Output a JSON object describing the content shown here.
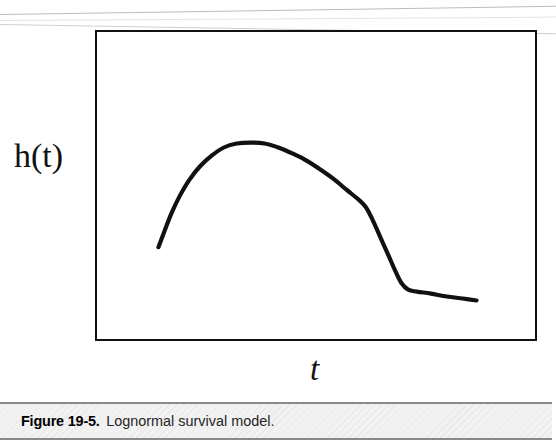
{
  "figure": {
    "caption_number": "Figure 19-5.",
    "caption_title": "Lognormal survival model.",
    "y_axis_label": "h(t)",
    "x_axis_label": "t",
    "frame_color": "#111111",
    "curve_color": "#111111",
    "background_color": "#ffffff",
    "caption_bar_color": "#f2f2f2"
  },
  "chart_data": {
    "type": "line",
    "title": "Lognormal survival model",
    "xlabel": "t",
    "ylabel": "h(t)",
    "legend": [],
    "grid": false,
    "axis_ticks": [],
    "xlim": [
      0,
      1
    ],
    "ylim": [
      0,
      1
    ],
    "annotation": "Hazard function of the lognormal distribution: rises from zero to a single interior maximum, then decays toward zero as t increases.",
    "series": [
      {
        "name": "hazard h(t)",
        "description": "unimodal hazard curve: rapid rise, rounded peak, gradual then steep decline, long flat tail",
        "points_px": [
          [
            157,
            248
          ],
          [
            163,
            232
          ],
          [
            170,
            214
          ],
          [
            178,
            197
          ],
          [
            188,
            180
          ],
          [
            199,
            166
          ],
          [
            211,
            155
          ],
          [
            223,
            147
          ],
          [
            236,
            143
          ],
          [
            250,
            142
          ],
          [
            264,
            143
          ],
          [
            278,
            147
          ],
          [
            292,
            153
          ],
          [
            306,
            160
          ],
          [
            320,
            169
          ],
          [
            334,
            179
          ],
          [
            347,
            190
          ],
          [
            358,
            199
          ],
          [
            366,
            207
          ],
          [
            373,
            220
          ],
          [
            381,
            238
          ],
          [
            389,
            256
          ],
          [
            396,
            272
          ],
          [
            402,
            284
          ],
          [
            409,
            291
          ],
          [
            418,
            293
          ],
          [
            432,
            295
          ],
          [
            448,
            298
          ],
          [
            464,
            300
          ],
          [
            478,
            302
          ]
        ],
        "normalized": [
          [
            0.14,
            0.337
          ],
          [
            0.154,
            0.38
          ],
          [
            0.17,
            0.428
          ],
          [
            0.188,
            0.473
          ],
          [
            0.21,
            0.519
          ],
          [
            0.235,
            0.556
          ],
          [
            0.262,
            0.585
          ],
          [
            0.29,
            0.607
          ],
          [
            0.319,
            0.618
          ],
          [
            0.351,
            0.621
          ],
          [
            0.382,
            0.618
          ],
          [
            0.414,
            0.607
          ],
          [
            0.446,
            0.591
          ],
          [
            0.477,
            0.572
          ],
          [
            0.509,
            0.548
          ],
          [
            0.541,
            0.521
          ],
          [
            0.57,
            0.492
          ],
          [
            0.595,
            0.468
          ],
          [
            0.613,
            0.446
          ],
          [
            0.629,
            0.411
          ],
          [
            0.647,
            0.363
          ],
          [
            0.665,
            0.315
          ],
          [
            0.681,
            0.272
          ],
          [
            0.695,
            0.24
          ],
          [
            0.71,
            0.221
          ],
          [
            0.731,
            0.215
          ],
          [
            0.762,
            0.21
          ],
          [
            0.799,
            0.202
          ],
          [
            0.836,
            0.196
          ],
          [
            0.867,
            0.191
          ]
        ]
      }
    ]
  }
}
